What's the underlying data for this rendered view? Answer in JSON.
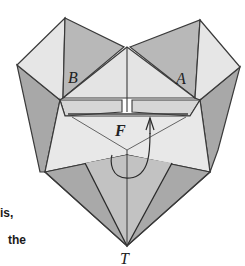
{
  "diagram": {
    "labels": {
      "a": "A",
      "b": "B",
      "f": "F",
      "t": "T"
    },
    "caption_fragments": [
      "is,",
      "the"
    ],
    "colors": {
      "light": "#e4e4e4",
      "mid": "#bdbdbd",
      "dark": "#9d9d9d",
      "line": "#3a3a3a",
      "background": "#ffffff"
    }
  }
}
